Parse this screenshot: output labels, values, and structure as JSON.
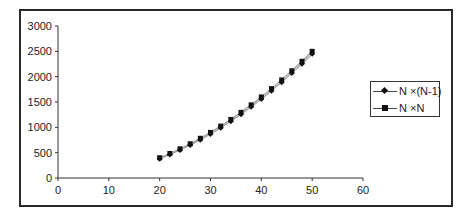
{
  "chart_data": {
    "type": "line",
    "title": "",
    "xlabel": "",
    "ylabel": "",
    "xlim": [
      0,
      60
    ],
    "ylim": [
      0,
      3000
    ],
    "x_ticks": [
      0,
      10,
      20,
      30,
      40,
      50,
      60
    ],
    "y_ticks": [
      0,
      500,
      1000,
      1500,
      2000,
      2500,
      3000
    ],
    "grid": false,
    "legend_position": "right",
    "x": [
      20,
      22,
      24,
      26,
      28,
      30,
      32,
      34,
      36,
      38,
      40,
      42,
      44,
      46,
      48,
      50
    ],
    "series": [
      {
        "name": "N ×(N-1)",
        "marker": "diamond",
        "values": [
          380,
          462,
          552,
          650,
          756,
          870,
          992,
          1122,
          1260,
          1406,
          1560,
          1722,
          1892,
          2070,
          2256,
          2450
        ]
      },
      {
        "name": "N ×N",
        "marker": "square",
        "values": [
          400,
          484,
          576,
          676,
          784,
          900,
          1024,
          1156,
          1296,
          1444,
          1600,
          1764,
          1936,
          2116,
          2304,
          2500
        ]
      }
    ]
  },
  "legend": {
    "items": [
      {
        "label": "N ×(N-1)"
      },
      {
        "label": "N ×N"
      }
    ]
  },
  "colors": {
    "line": "#9a9a9a",
    "marker": "#111111",
    "axis": "#333333",
    "frame": "#2a2a2a"
  }
}
